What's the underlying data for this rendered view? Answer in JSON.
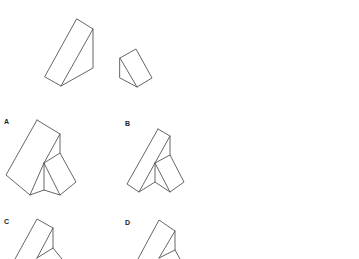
{
  "question": {
    "given_pieces": [
      "large-triangular-prism",
      "small-triangular-prism"
    ]
  },
  "options": [
    {
      "label": "A"
    },
    {
      "label": "B"
    },
    {
      "label": "C"
    },
    {
      "label": "D"
    }
  ],
  "colors": {
    "background": "#ffffff",
    "line": "#555555",
    "label": "#222222"
  }
}
